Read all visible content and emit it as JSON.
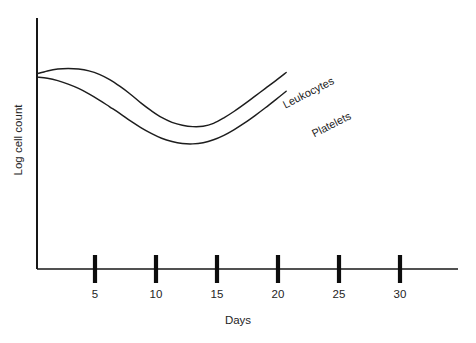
{
  "chart_data": {
    "type": "line",
    "title": "",
    "xlabel": "Days",
    "ylabel": "Log cell count",
    "xlim": [
      0,
      34
    ],
    "ylim": [
      0,
      10
    ],
    "grid": false,
    "legend_position": "inline-curve-labels",
    "xticks": [
      "5",
      "10",
      "15",
      "20",
      "25",
      "30"
    ],
    "xtick_values": [
      5,
      10,
      15,
      20,
      25,
      30
    ],
    "yticks": [],
    "annotations": [
      {
        "text": "Leukocytes",
        "attached_to": "Leukocytes",
        "rotation_deg": -27
      },
      {
        "text": "Platelets",
        "attached_to": "Platelets",
        "rotation_deg": -27
      }
    ],
    "series": [
      {
        "name": "Leukocytes",
        "x": [
          0,
          1,
          2,
          3,
          4,
          5,
          6,
          7,
          8,
          9,
          10,
          11,
          12,
          13,
          14,
          15,
          16,
          17,
          18,
          19,
          20,
          21,
          22,
          23,
          24
        ],
        "values": [
          8.05,
          8.2,
          8.3,
          8.33,
          8.3,
          8.2,
          8.02,
          7.75,
          7.4,
          7.0,
          6.55,
          6.15,
          5.8,
          5.55,
          5.4,
          5.33,
          5.35,
          5.5,
          5.78,
          6.12,
          6.5,
          6.9,
          7.3,
          7.7,
          8.12
        ]
      },
      {
        "name": "Platelets",
        "x": [
          0,
          1,
          2,
          3,
          4,
          5,
          6,
          7,
          8,
          9,
          10,
          11,
          12,
          13,
          14,
          15,
          16,
          17,
          18,
          19,
          20,
          21,
          22,
          23,
          24
        ],
        "values": [
          7.88,
          7.82,
          7.7,
          7.52,
          7.3,
          7.02,
          6.7,
          6.35,
          6.0,
          5.62,
          5.28,
          4.98,
          4.73,
          4.56,
          4.46,
          4.44,
          4.5,
          4.65,
          4.88,
          5.18,
          5.52,
          5.9,
          6.3,
          6.72,
          7.15
        ]
      }
    ]
  },
  "axes": {
    "x_axis_name": "days-axis",
    "y_axis_name": "log-cell-count-axis"
  },
  "colors": {
    "curve": "#1d1d1d",
    "axis": "#171717",
    "text": "#242424",
    "background": "#ffffff"
  }
}
